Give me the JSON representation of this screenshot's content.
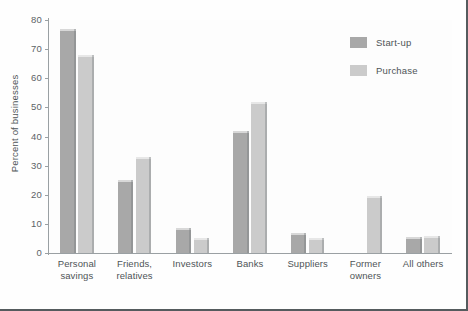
{
  "chart_data": {
    "type": "bar",
    "title": "",
    "xlabel": "",
    "ylabel": "Percent of businesses",
    "ylim": [
      0,
      80
    ],
    "yticks": [
      0,
      10,
      20,
      30,
      40,
      50,
      60,
      70,
      80
    ],
    "grid": false,
    "legend_position": "top-right",
    "categories": [
      "Personal savings",
      "Friends, relatives",
      "Investors",
      "Banks",
      "Suppliers",
      "Former owners",
      "All others"
    ],
    "category_lines": [
      [
        "Personal",
        "savings"
      ],
      [
        "Friends,",
        "relatives"
      ],
      [
        "Investors",
        ""
      ],
      [
        "Banks",
        ""
      ],
      [
        "Suppliers",
        ""
      ],
      [
        "Former",
        "owners"
      ],
      [
        "All others",
        ""
      ]
    ],
    "series": [
      {
        "name": "Start-up",
        "color": "#a8a8a8",
        "values": [
          77,
          25,
          8.5,
          42,
          7,
          null,
          5.5
        ]
      },
      {
        "name": "Purchase",
        "color": "#cbcbcb",
        "values": [
          68,
          33,
          5,
          52,
          5,
          19.5,
          6
        ]
      }
    ]
  },
  "legend": {
    "items": [
      {
        "label": "Start-up",
        "color": "#a8a8a8"
      },
      {
        "label": "Purchase",
        "color": "#cbcbcb"
      }
    ]
  },
  "axis": {
    "y_title": "Percent of businesses",
    "y_tick_labels": [
      "0",
      "10",
      "20",
      "30",
      "40",
      "50",
      "60",
      "70",
      "80"
    ]
  },
  "colors": {
    "startup": "#a8a8a8",
    "purchase": "#cbcbcb",
    "axis": "#9aa0a3",
    "text": "#4e5457",
    "frame": "#555b5e"
  }
}
